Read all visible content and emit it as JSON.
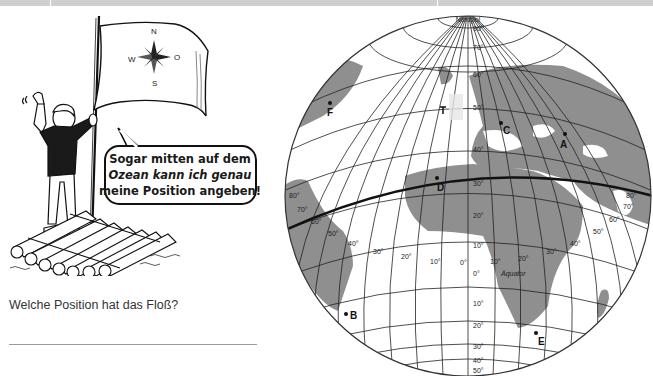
{
  "worksheet": {
    "topbar": {
      "color": "#cfcfcf",
      "separators_x": [
        50,
        437
      ]
    },
    "cartoon": {
      "flag": {
        "compass": {
          "north": "N",
          "east": "O",
          "south": "S",
          "west": "W"
        }
      },
      "speech_bubble": {
        "lines": [
          "Sogar mitten auf dem",
          "Ozean kann ich genau",
          "meine Position angeben!"
        ]
      }
    },
    "question": "Welche Position hat das Floß?",
    "answer_line": ""
  },
  "globe": {
    "north_pole_label": "Nordpol",
    "equator_label": "Äquator",
    "latitude_labels": [
      "90°",
      "70°",
      "60°",
      "50°",
      "40°",
      "30°",
      "20°",
      "10°",
      "0°",
      "10°",
      "20°",
      "30°",
      "40°",
      "50°"
    ],
    "longitude_labels_west": [
      "80°",
      "70°",
      "60°",
      "50°",
      "40°",
      "30°",
      "20°",
      "10°"
    ],
    "longitude_labels_east": [
      "0°",
      "10°",
      "20°",
      "30°",
      "40°",
      "50°",
      "60°",
      "70°",
      "80°"
    ],
    "points": [
      {
        "id": "A",
        "label": "A"
      },
      {
        "id": "B",
        "label": "B"
      },
      {
        "id": "C",
        "label": "C"
      },
      {
        "id": "D",
        "label": "D"
      },
      {
        "id": "E",
        "label": "E"
      },
      {
        "id": "F",
        "label": "F"
      }
    ],
    "colors": {
      "land": "#8f8f8f",
      "ocean": "#ffffff",
      "grid": "#222222",
      "equator": "#111111"
    }
  }
}
